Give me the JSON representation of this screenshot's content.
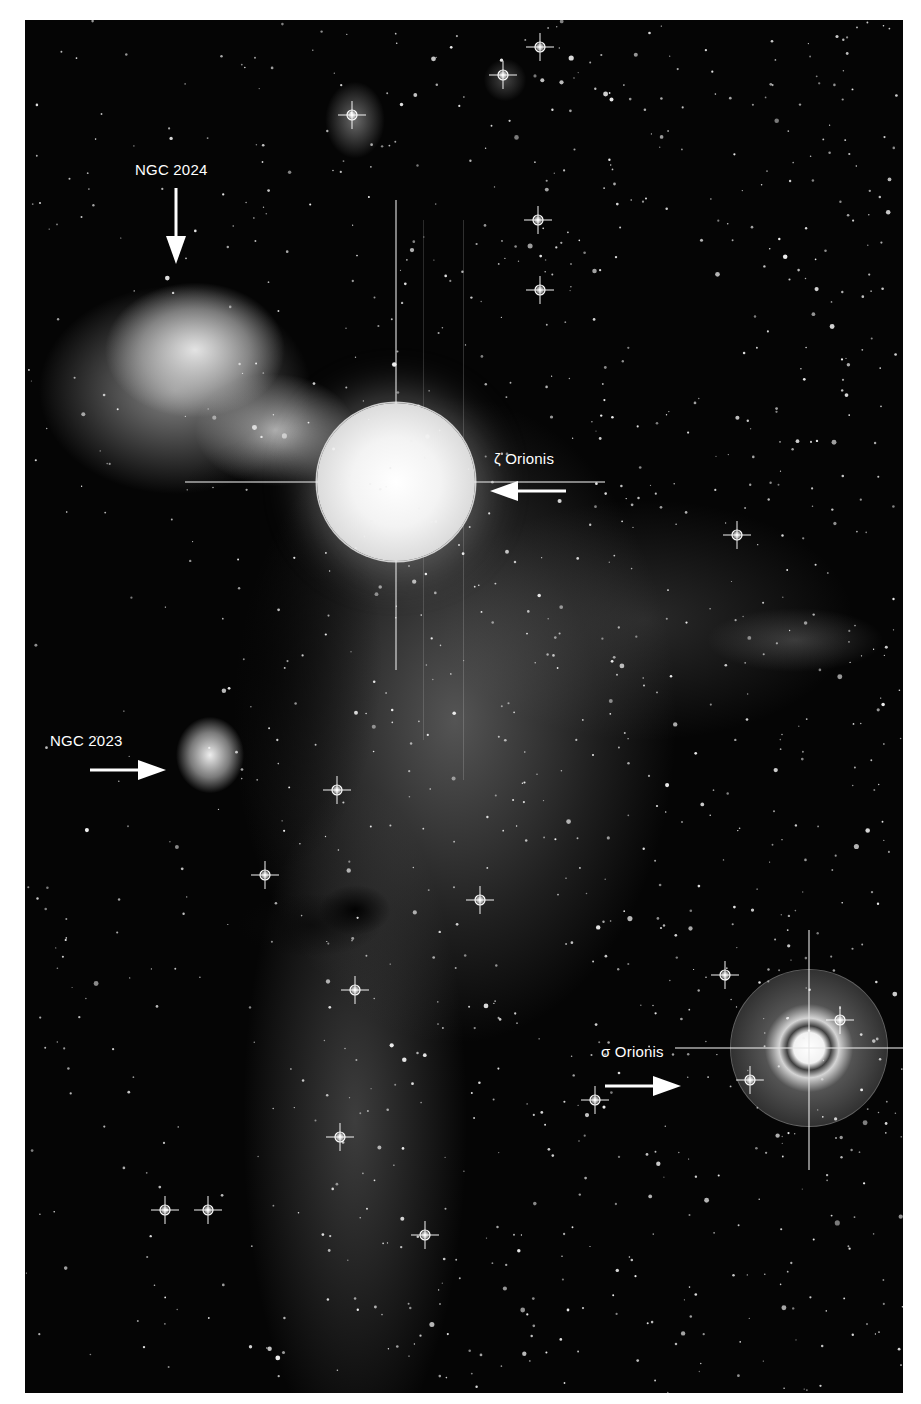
{
  "image": {
    "description": "Astronomical photograph of the Horsehead Nebula region in Orion, grayscale, with annotated labels and arrows",
    "background": "#ffffff",
    "frame_color": "#050505"
  },
  "annotations": [
    {
      "id": "ngc2024",
      "label": "NGC 2024",
      "arrow_direction": "down",
      "object": "Flame Nebula"
    },
    {
      "id": "zeta-orionis",
      "label": "ζ Orionis",
      "arrow_direction": "left",
      "object": "bright star"
    },
    {
      "id": "ngc2023",
      "label": "NGC 2023",
      "arrow_direction": "right",
      "object": "reflection nebula"
    },
    {
      "id": "sigma-orionis",
      "label": "σ Orionis",
      "arrow_direction": "right",
      "object": "bright star"
    }
  ]
}
